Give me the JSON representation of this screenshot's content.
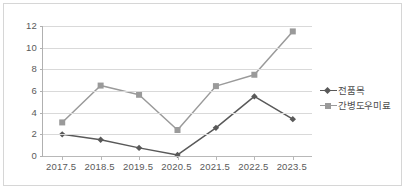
{
  "chart_data": {
    "type": "line",
    "title": "",
    "xlabel": "",
    "ylabel": "",
    "x": [
      2017.5,
      2018.5,
      2019.5,
      2020.5,
      2021.5,
      2022.5,
      2023.5
    ],
    "categories": [
      "2017.5",
      "2018.5",
      "2019.5",
      "2020.5",
      "2021.5",
      "2022.5",
      "2023.5"
    ],
    "ylim": [
      0,
      12
    ],
    "yticks": [
      0,
      2,
      4,
      6,
      8,
      10,
      12
    ],
    "ytick_labels": [
      "0",
      "2",
      "4",
      "6",
      "8",
      "10",
      "12"
    ],
    "grid": true,
    "legend_position": "right",
    "series": [
      {
        "name": "전품목",
        "values": [
          2.0,
          1.5,
          0.75,
          0.1,
          2.6,
          5.5,
          3.4
        ],
        "color": "#595959",
        "marker": "diamond"
      },
      {
        "name": "간병도우미료",
        "values": [
          3.1,
          6.5,
          5.65,
          2.4,
          6.45,
          7.5,
          11.5
        ],
        "color": "#9a9a9a",
        "marker": "square"
      }
    ]
  },
  "legend": {
    "items": [
      {
        "label": "전품목",
        "color": "#595959",
        "marker": "diamond"
      },
      {
        "label": "간병도우미료",
        "color": "#9a9a9a",
        "marker": "square"
      }
    ]
  },
  "colors": {
    "series_all_items": "#595959",
    "series_caregiver_fee": "#9a9a9a",
    "gridline": "#d9d9d9",
    "axis": "#b0b0b0",
    "tick_text": "#5a5a5a",
    "frame": "#d6d6d6",
    "background": "#ffffff"
  }
}
